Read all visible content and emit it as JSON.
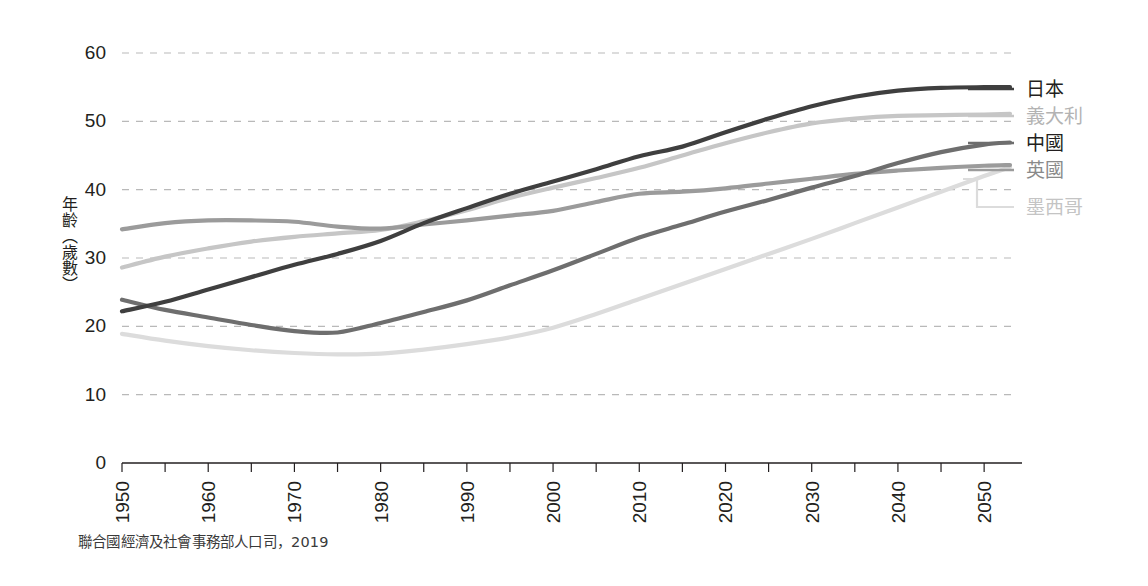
{
  "chart_data": {
    "type": "line",
    "title": "",
    "xlabel": "",
    "ylabel": "年齡（歲數）",
    "ylim": [
      0,
      62
    ],
    "xlim": [
      1950,
      2053
    ],
    "grid": true,
    "legend_position": "right",
    "y_ticks": [
      0,
      10,
      20,
      30,
      40,
      50,
      60
    ],
    "x_ticks_major": [
      1950,
      1960,
      1970,
      1980,
      1990,
      2000,
      2010,
      2020,
      2030,
      2040,
      2050
    ],
    "x_ticks_minor": [
      1955,
      1965,
      1975,
      1985,
      1995,
      2005,
      2015,
      2025,
      2035,
      2045
    ],
    "x": [
      1950,
      1955,
      1960,
      1965,
      1970,
      1975,
      1980,
      1985,
      1990,
      1995,
      2000,
      2005,
      2010,
      2015,
      2020,
      2025,
      2030,
      2035,
      2040,
      2045,
      2050,
      2053
    ],
    "series": [
      {
        "name": "日本",
        "color": "#3f3f3f",
        "values": [
          22.2,
          23.6,
          25.4,
          27.2,
          29.0,
          30.6,
          32.5,
          35.1,
          37.3,
          39.4,
          41.2,
          43.0,
          44.9,
          46.3,
          48.4,
          50.4,
          52.2,
          53.6,
          54.5,
          54.9,
          55.0,
          55.0
        ]
      },
      {
        "name": "義大利",
        "color": "#c6c6c6",
        "values": [
          28.6,
          30.2,
          31.4,
          32.4,
          33.1,
          33.6,
          34.1,
          35.4,
          37.0,
          38.8,
          40.3,
          41.7,
          43.2,
          45.0,
          46.8,
          48.4,
          49.7,
          50.4,
          50.8,
          50.9,
          51.0,
          51.1
        ]
      },
      {
        "name": "中國",
        "color": "#6e6e6e",
        "values": [
          23.9,
          22.4,
          21.3,
          20.2,
          19.3,
          19.1,
          20.5,
          22.1,
          23.8,
          26.0,
          28.2,
          30.6,
          33.0,
          34.9,
          36.8,
          38.5,
          40.3,
          42.0,
          43.9,
          45.5,
          46.6,
          46.9
        ]
      },
      {
        "name": "英國",
        "color": "#9b9b9b",
        "values": [
          34.2,
          35.1,
          35.5,
          35.5,
          35.3,
          34.6,
          34.3,
          34.9,
          35.5,
          36.2,
          36.9,
          38.2,
          39.4,
          39.7,
          40.2,
          40.9,
          41.6,
          42.3,
          42.8,
          43.2,
          43.5,
          43.6
        ]
      },
      {
        "name": "墨西哥",
        "color": "#dcdcdc",
        "values": [
          18.9,
          17.9,
          17.1,
          16.5,
          16.1,
          15.9,
          16.0,
          16.6,
          17.4,
          18.4,
          19.8,
          21.8,
          24.0,
          26.2,
          28.4,
          30.6,
          32.8,
          35.1,
          37.4,
          39.7,
          42.0,
          43.3
        ]
      }
    ]
  },
  "legend": {
    "items": [
      {
        "label": "日本",
        "color": "#3f3f3f",
        "text_color": "#231f20"
      },
      {
        "label": "義大利",
        "color": "#c6c6c6",
        "text_color": "#b3b3b3"
      },
      {
        "label": "中國",
        "color": "#6e6e6e",
        "text_color": "#231f20"
      },
      {
        "label": "英國",
        "color": "#9b9b9b",
        "text_color": "#8a8a8a"
      },
      {
        "label": "墨西哥",
        "color": "#dcdcdc",
        "text_color": "#c4c4c4"
      }
    ]
  },
  "source": {
    "text": "聯合國經濟及社會事務部人口司，2019"
  },
  "axis": {
    "y_label": "年齡（歲數）",
    "y_tick_labels": [
      "60",
      "50",
      "40",
      "30",
      "20",
      "10",
      "0"
    ],
    "x_tick_labels": [
      "1950",
      "1960",
      "1970",
      "1980",
      "1990",
      "2000",
      "2010",
      "2020",
      "2030",
      "2040",
      "2050"
    ]
  },
  "colors": {
    "axis": "#231f20",
    "grid": "#b9b9b9",
    "background": "#ffffff"
  }
}
